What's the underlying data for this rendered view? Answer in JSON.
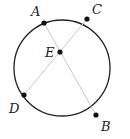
{
  "diagram": {
    "type": "circle-with-intersecting-chords",
    "circle": {
      "cx": 62,
      "cy": 68,
      "r": 48,
      "stroke": "#222222"
    },
    "chord_color": "#c8c8c8",
    "point_color": "#111111",
    "points": {
      "A": {
        "label": "A",
        "x": 44,
        "y": 23,
        "lx": 31,
        "ly": 16
      },
      "C": {
        "label": "C",
        "x": 87,
        "y": 19,
        "lx": 92,
        "ly": 14
      },
      "E": {
        "label": "E",
        "x": 60,
        "y": 52,
        "lx": 45,
        "ly": 57
      },
      "D": {
        "label": "D",
        "x": 24,
        "y": 95,
        "lx": 9,
        "ly": 113
      },
      "B": {
        "label": "B",
        "x": 96,
        "y": 115,
        "lx": 101,
        "ly": 131
      }
    },
    "chords": [
      {
        "from": "A",
        "to": "B"
      },
      {
        "from": "C",
        "to": "D"
      }
    ]
  }
}
